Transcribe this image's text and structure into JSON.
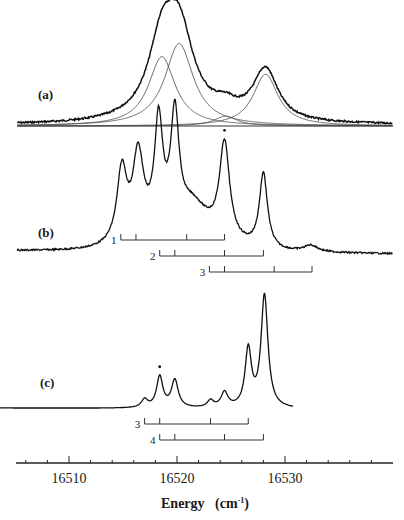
{
  "chart_data": {
    "type": "line",
    "title": "",
    "xlabel": "Energy (cm-1)",
    "xlabel_main": "Energy",
    "xlabel_unit_open": "(cm",
    "xlabel_unit_sup": "-1",
    "xlabel_unit_close": ")",
    "ylabel": "",
    "xlim": [
      16505,
      16540
    ],
    "x_ticks_major": [
      16510,
      16520,
      16530
    ],
    "x_tick_labels": [
      "16510",
      "16520",
      "16530"
    ],
    "x_minor_step": 2,
    "grid": false,
    "panels": [
      {
        "label": "(a)",
        "kind": "fitted-envelope",
        "peaks": [
          {
            "x": 16518.6,
            "height": 0.63,
            "width": 1.5
          },
          {
            "x": 16520.2,
            "height": 0.75,
            "width": 1.6
          },
          {
            "x": 16524.5,
            "height": 0.09,
            "width": 1.3
          },
          {
            "x": 16528.2,
            "height": 0.47,
            "width": 1.4
          }
        ],
        "envelope_extra": 0.03,
        "x_range": [
          16505.2,
          16540
        ]
      },
      {
        "label": "(b)",
        "kind": "spectrum",
        "peaks": [
          {
            "x": 16514.9,
            "height": 0.55,
            "width": 0.55
          },
          {
            "x": 16516.4,
            "height": 0.62,
            "width": 0.6
          },
          {
            "x": 16518.3,
            "height": 0.8,
            "width": 0.45
          },
          {
            "x": 16519.8,
            "height": 0.82,
            "width": 0.45
          },
          {
            "x": 16521.5,
            "height": 0.15,
            "width": 1.4
          },
          {
            "x": 16524.4,
            "height": 0.73,
            "width": 0.55
          },
          {
            "x": 16528.0,
            "height": 0.58,
            "width": 0.45
          },
          {
            "x": 16532.4,
            "height": 0.05,
            "width": 0.8
          }
        ],
        "broad": {
          "x": 16520.5,
          "height": 0.2,
          "width": 4.5
        },
        "starred_peak_x": 16524.4,
        "x_range": [
          16505.2,
          16540
        ],
        "progressions": [
          {
            "label": "1",
            "ticks": [
              16514.8,
              16516.2,
              16520.9,
              16524.4
            ]
          },
          {
            "label": "2",
            "ticks": [
              16518.4,
              16519.8,
              16524.4,
              16528.0
            ]
          },
          {
            "label": "3",
            "ticks": [
              16523.0,
              16524.4,
              16529.0,
              16532.5
            ]
          }
        ]
      },
      {
        "label": "(c)",
        "kind": "spectrum",
        "peaks": [
          {
            "x": 16517.0,
            "height": 0.07,
            "width": 0.35
          },
          {
            "x": 16518.4,
            "height": 0.27,
            "width": 0.35
          },
          {
            "x": 16519.8,
            "height": 0.24,
            "width": 0.38
          },
          {
            "x": 16523.1,
            "height": 0.06,
            "width": 0.35
          },
          {
            "x": 16524.4,
            "height": 0.13,
            "width": 0.38
          },
          {
            "x": 16526.6,
            "height": 0.5,
            "width": 0.35
          },
          {
            "x": 16528.1,
            "height": 0.98,
            "width": 0.38
          }
        ],
        "starred_peak_x": 16518.4,
        "x_range": [
          16503.5,
          16530.8
        ],
        "progressions": [
          {
            "label": "3",
            "ticks": [
              16517.0,
              16518.4,
              16523.1,
              16526.6
            ]
          },
          {
            "label": "4",
            "ticks": [
              16518.4,
              16519.8,
              16524.4,
              16528.0
            ]
          }
        ]
      }
    ]
  }
}
